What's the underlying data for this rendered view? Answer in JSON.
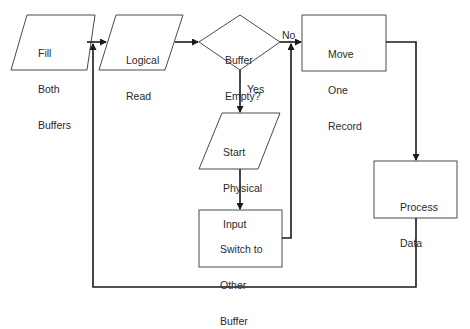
{
  "diagram": {
    "type": "flowchart",
    "nodes": {
      "fill": {
        "shape": "parallelogram",
        "lines": [
          "Fill",
          "Both",
          "Buffers"
        ]
      },
      "read": {
        "shape": "parallelogram",
        "lines": [
          "Logical",
          "Read"
        ]
      },
      "empty": {
        "shape": "diamond",
        "lines": [
          "Buffer",
          "Empty?"
        ]
      },
      "move": {
        "shape": "rectangle",
        "lines": [
          "Move",
          "One",
          "Record"
        ]
      },
      "start": {
        "shape": "parallelogram",
        "lines": [
          "Start",
          "Physical",
          "Input"
        ]
      },
      "switch": {
        "shape": "rectangle",
        "lines": [
          "Switch to",
          "Other",
          "Buffer"
        ]
      },
      "process": {
        "shape": "rectangle",
        "lines": [
          "Process",
          "Data"
        ]
      }
    },
    "edge_labels": {
      "no": "No",
      "yes": "Yes"
    },
    "edges": [
      {
        "from": "fill",
        "to": "read"
      },
      {
        "from": "read",
        "to": "empty"
      },
      {
        "from": "empty",
        "to": "move",
        "label": "No"
      },
      {
        "from": "empty",
        "to": "start",
        "label": "Yes"
      },
      {
        "from": "start",
        "to": "switch"
      },
      {
        "from": "switch",
        "to": "move"
      },
      {
        "from": "move",
        "to": "process"
      },
      {
        "from": "process",
        "to": "read"
      }
    ]
  }
}
